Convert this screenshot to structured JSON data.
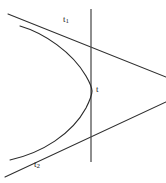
{
  "figure": {
    "background_color": "#ffffff",
    "stroke_color": "#2a2a2a",
    "width": 166,
    "height": 183,
    "labels": {
      "tangent_upper": {
        "base": "t",
        "sub": "1",
        "full": "t1",
        "x": 63,
        "y": 15
      },
      "axis": {
        "base": "t",
        "sub": "",
        "full": "t",
        "x": 96,
        "y": 85
      },
      "tangent_lower": {
        "base": "t",
        "sub": "2",
        "full": "t2",
        "x": 34,
        "y": 160
      }
    }
  },
  "chart_data": {
    "type": "line",
    "xlabel": "",
    "ylabel": "",
    "grid": false,
    "legend": "none",
    "xlim": [
      0,
      166
    ],
    "ylim": [
      183,
      0
    ],
    "series": [
      {
        "name": "curve",
        "role": "parabola-opening-left",
        "description": "Conic arc with vertex at right touching the vertical axis line",
        "path": "M 20,26 C 44,33 72,52 86,76 C 90,83 92,88 92,91 C 92,95 90,100 86,108 C 72,134 42,153 10,160",
        "vertex": [
          92,
          91
        ],
        "endpoints": [
          [
            20,
            26
          ],
          [
            10,
            160
          ]
        ]
      },
      {
        "name": "t",
        "role": "vertical-axis-line",
        "description": "Vertical line through the vertex of the parabola",
        "x1": 91,
        "y1": 9,
        "x2": 91,
        "y2": 162
      },
      {
        "name": "t1",
        "role": "tangent-upper",
        "description": "Tangent line touching the upper branch, sloping down to the right",
        "x1": 8,
        "y1": 14,
        "x2": 166,
        "y2": 77
      },
      {
        "name": "t2",
        "role": "tangent-lower",
        "description": "Tangent line touching the lower branch, sloping up to the right",
        "x1": 5,
        "y1": 177,
        "x2": 166,
        "y2": 102
      }
    ],
    "annotations": [
      {
        "text": "t1",
        "x": 63,
        "y": 15,
        "target": "t1"
      },
      {
        "text": "t",
        "x": 96,
        "y": 85,
        "target": "t"
      },
      {
        "text": "t2",
        "x": 34,
        "y": 160,
        "target": "t2"
      }
    ]
  }
}
